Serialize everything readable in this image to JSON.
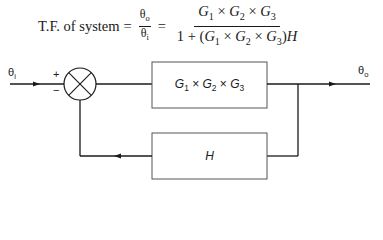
{
  "equation": {
    "lhs": "T.F. of system",
    "ratio_num": "θo",
    "ratio_den": "θi",
    "equals": "=",
    "numerator": "G1 × G2 × G3",
    "denominator": "1 + (G1 × G2 × G3)H"
  },
  "diagram": {
    "input_label": "θi",
    "output_label": "θo",
    "sum_plus": "+",
    "sum_minus": "−",
    "forward_block": "G1 × G2 × G3",
    "feedback_block": "H"
  },
  "colors": {
    "line": "#1a1a1a",
    "block_border": "#555555",
    "background": "#ffffff"
  }
}
